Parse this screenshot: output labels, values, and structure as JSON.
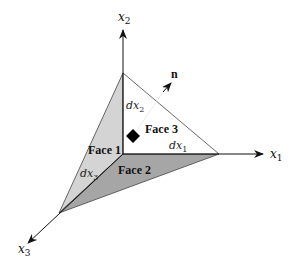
{
  "diagram": {
    "axes": [
      {
        "id": "x1",
        "label": "x",
        "sub": "1"
      },
      {
        "id": "x2",
        "label": "x",
        "sub": "2"
      },
      {
        "id": "x3",
        "label": "x",
        "sub": "3"
      }
    ],
    "faces": [
      {
        "id": "face1",
        "label": "Face 1",
        "color": "#d4d4d4"
      },
      {
        "id": "face2",
        "label": "Face 2",
        "color": "#a6a6a6"
      },
      {
        "id": "face3",
        "label": "Face 3",
        "color": "#ffffff"
      }
    ],
    "edges": [
      {
        "id": "dx1",
        "label": "dx",
        "sub": "1"
      },
      {
        "id": "dx2",
        "label": "dx",
        "sub": "2"
      },
      {
        "id": "dx3",
        "label": "dx",
        "sub": "3"
      }
    ],
    "normal": {
      "label": "n"
    },
    "colors": {
      "line": "#222222",
      "face1": "#d4d4d4",
      "face2": "#a6a6a6",
      "background": "#ffffff"
    }
  }
}
